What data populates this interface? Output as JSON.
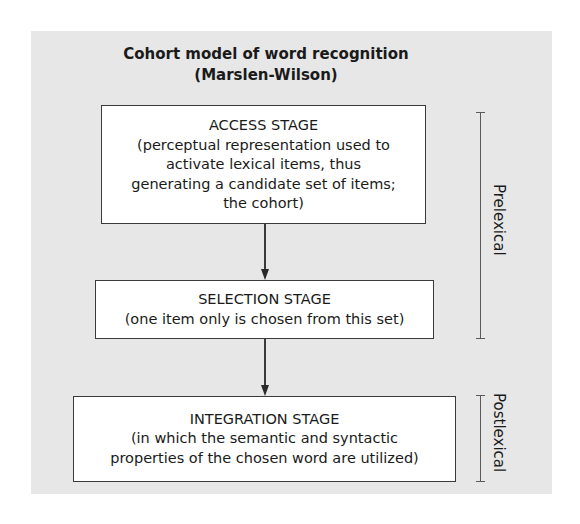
{
  "diagram": {
    "title": {
      "line1": "Cohort model of word recognition",
      "line2": "(Marslen-Wilson)"
    },
    "stages": [
      {
        "name": "ACCESS STAGE",
        "description_lines": [
          "(perceptual representation used to",
          "activate lexical items, thus",
          "generating a candidate set of items;",
          "the cohort)"
        ]
      },
      {
        "name": "SELECTION STAGE",
        "description_lines": [
          "(one item only is chosen from this set)"
        ]
      },
      {
        "name": "INTEGRATION STAGE",
        "description_lines": [
          "(in which the semantic and syntactic",
          "properties of the chosen word are utilized)"
        ]
      }
    ],
    "brackets": [
      {
        "label": "Prelexical",
        "spans_stages": [
          "ACCESS STAGE",
          "SELECTION STAGE"
        ]
      },
      {
        "label": "Postlexical",
        "spans_stages": [
          "INTEGRATION STAGE"
        ]
      }
    ],
    "edges": [
      {
        "from": "ACCESS STAGE",
        "to": "SELECTION STAGE"
      },
      {
        "from": "SELECTION STAGE",
        "to": "INTEGRATION STAGE"
      }
    ],
    "colors": {
      "panel_background": "#e7e7e7",
      "box_background": "#ffffff",
      "box_border": "#3a3a3a",
      "text": "#1a1a1a"
    }
  }
}
